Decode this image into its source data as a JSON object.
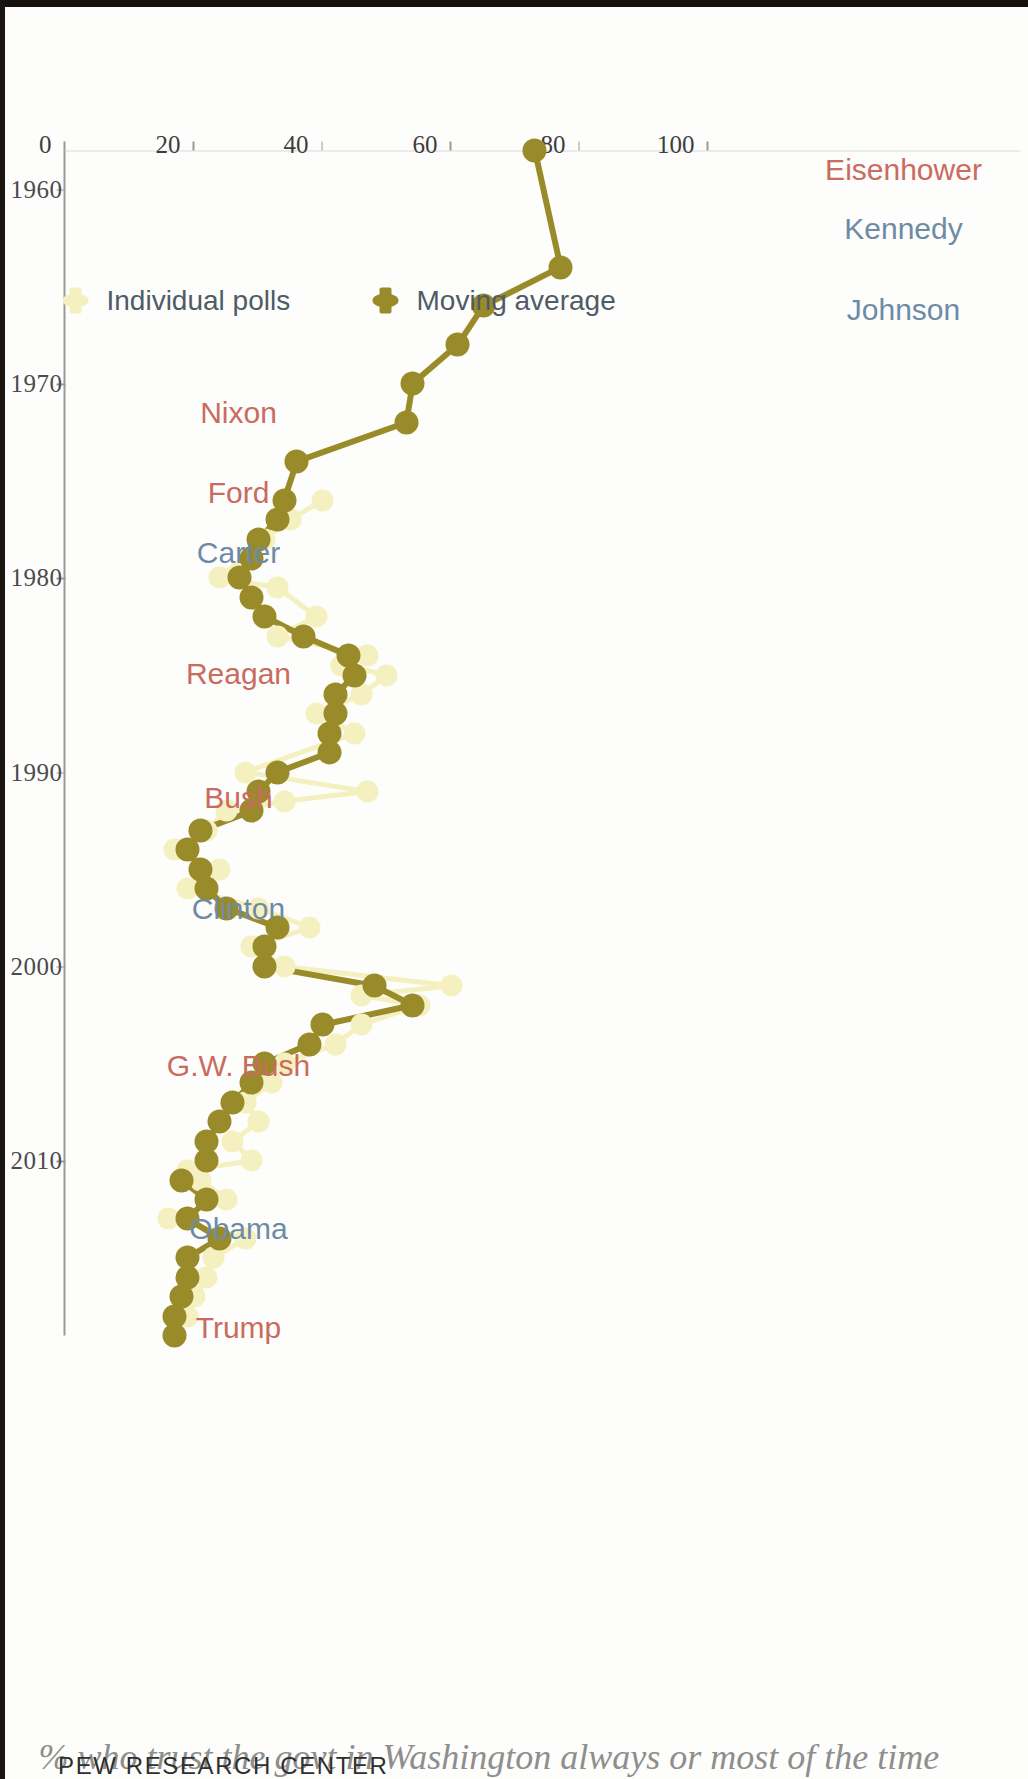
{
  "title": "% who trust the govt in Washington always or most of the time",
  "credit": "PEW RESEARCH CENTER",
  "colors": {
    "moving_average": "#9a8b2a",
    "individual_polls": "#f5f0c0",
    "republican": "#c96b5e",
    "democrat": "#6d8ba6",
    "axis": "#9a9a9a",
    "title": "#8e8e8e",
    "background": "#fdfdfb"
  },
  "legend": {
    "position": "inside-left",
    "items": [
      {
        "label": "Moving average",
        "color": "#9a8b2a",
        "marker": "line-dot"
      },
      {
        "label": "Individual polls",
        "color": "#f5f0c0",
        "marker": "dot"
      }
    ]
  },
  "presidents": [
    {
      "name": "Eisenhower",
      "party": "rep",
      "year": 1959.0
    },
    {
      "name": "Kennedy",
      "party": "dem",
      "year": 1962.0
    },
    {
      "name": "Johnson",
      "party": "dem",
      "year": 1966.2
    },
    {
      "name": "Nixon",
      "party": "rep",
      "year": 1971.5
    },
    {
      "name": "Ford",
      "party": "rep",
      "year": 1975.6
    },
    {
      "name": "Carter",
      "party": "dem",
      "year": 1978.7
    },
    {
      "name": "Reagan",
      "party": "rep",
      "year": 1984.9
    },
    {
      "name": "Bush",
      "party": "rep",
      "year": 1991.3
    },
    {
      "name": "Clinton",
      "party": "dem",
      "year": 1997.0
    },
    {
      "name": "G.W. Bush",
      "party": "rep",
      "year": 2005.1
    },
    {
      "name": "Obama",
      "party": "dem",
      "year": 2013.5
    },
    {
      "name": "Trump",
      "party": "rep",
      "year": 2018.6
    }
  ],
  "chart_data": {
    "type": "line",
    "title": "% who trust the govt in Washington always or most of the time",
    "xlabel": "",
    "ylabel": "",
    "xlim": [
      1958,
      2019
    ],
    "ylim": [
      0,
      100
    ],
    "grid": false,
    "xticks": [
      1960,
      1970,
      1980,
      1990,
      2000,
      2010
    ],
    "xticklabels": [
      "1960",
      "1970",
      "1980",
      "1990",
      "2000",
      "2010"
    ],
    "yticks": [
      0,
      20,
      40,
      60,
      80,
      100
    ],
    "yticklabels": [
      "0",
      "20",
      "40",
      "60",
      "80",
      "100"
    ],
    "series": [
      {
        "name": "Moving average",
        "color": "#9a8b2a",
        "marker": "o",
        "x": [
          1958,
          1964,
          1966,
          1968,
          1970,
          1972,
          1974,
          1976,
          1977,
          1978,
          1979,
          1980,
          1981,
          1982,
          1983,
          1984,
          1985,
          1986,
          1987,
          1988,
          1989,
          1990,
          1991,
          1992,
          1993,
          1994,
          1995,
          1996,
          1997,
          1998,
          1999,
          2000,
          2001,
          2002,
          2003,
          2004,
          2005,
          2006,
          2007,
          2008,
          2009,
          2010,
          2011,
          2012,
          2013,
          2014,
          2015,
          2016,
          2017,
          2018,
          2019
        ],
        "y": [
          73,
          77,
          65,
          61,
          54,
          53,
          36,
          34,
          33,
          30,
          29,
          27,
          29,
          31,
          37,
          44,
          45,
          42,
          42,
          41,
          41,
          33,
          30,
          29,
          21,
          19,
          21,
          22,
          25,
          33,
          31,
          31,
          48,
          54,
          40,
          38,
          31,
          29,
          26,
          24,
          22,
          22,
          18,
          22,
          19,
          24,
          19,
          19,
          18,
          17,
          17
        ]
      },
      {
        "name": "Individual polls",
        "color": "#f5f0c0",
        "marker": "o",
        "x": [
          1976,
          1977,
          1978,
          1980,
          1980.5,
          1982,
          1983,
          1984,
          1984.5,
          1985,
          1986,
          1987,
          1988,
          1990,
          1991,
          1991.5,
          1992,
          1993,
          1994,
          1995,
          1996,
          1997,
          1998,
          1999,
          2000,
          2001,
          2001.5,
          2002,
          2003,
          2004,
          2005,
          2006,
          2007,
          2008,
          2009,
          2010,
          2010.5,
          2011,
          2012,
          2013,
          2014,
          2015,
          2016,
          2017,
          2018
        ],
        "y": [
          40,
          35,
          31,
          24,
          33,
          39,
          33,
          47,
          43,
          50,
          46,
          39,
          45,
          28,
          47,
          34,
          25,
          22,
          17,
          24,
          19,
          30,
          38,
          29,
          34,
          60,
          46,
          55,
          46,
          42,
          34,
          32,
          28,
          30,
          26,
          29,
          19,
          21,
          25,
          16,
          28,
          23,
          22,
          20,
          19
        ]
      }
    ]
  }
}
